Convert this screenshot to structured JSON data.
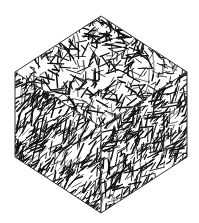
{
  "figure": {
    "background": "#ffffff",
    "ink": "#111111",
    "outline": "#333333",
    "vertices": {
      "top": [
        101,
        16
      ],
      "left_top": [
        15,
        72
      ],
      "right_top": [
        187,
        72
      ],
      "center": [
        101,
        127
      ],
      "left_bottom": [
        15,
        157
      ],
      "right_bottom": [
        187,
        157
      ],
      "bottom": [
        101,
        213
      ]
    },
    "faces": [
      "top",
      "left",
      "right"
    ]
  }
}
